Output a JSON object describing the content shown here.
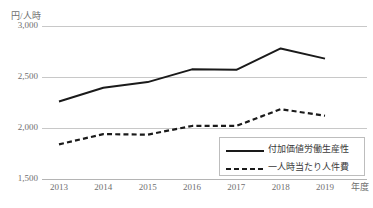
{
  "chart_data": {
    "type": "line",
    "title": "",
    "ylabel": "円/人時",
    "xlabel": "年度",
    "categories": [
      "2013",
      "2014",
      "2015",
      "2016",
      "2017",
      "2018",
      "2019"
    ],
    "ylim": [
      1500,
      3000
    ],
    "yticks": [
      "3,000",
      "2,500",
      "2,000",
      "1,500"
    ],
    "ytick_values": [
      3000,
      2500,
      2000,
      1500
    ],
    "grid": true,
    "legend_position": "bottom-right",
    "series": [
      {
        "name": "付加価値労働生産性",
        "style": "solid",
        "color": "#1a1a1a",
        "values": [
          2260,
          2395,
          2450,
          2575,
          2570,
          2780,
          2680
        ]
      },
      {
        "name": "一人時当たり人件費",
        "style": "dashed",
        "color": "#1a1a1a",
        "values": [
          1840,
          1940,
          1935,
          2020,
          2020,
          2185,
          2120
        ]
      }
    ]
  },
  "axes": {
    "y_unit_label": "円/人時",
    "x_unit_label": "年度"
  },
  "legend": {
    "items": [
      {
        "label": "付加価値労働生産性",
        "style": "solid"
      },
      {
        "label": "一人時当たり人件費",
        "style": "dashed"
      }
    ]
  }
}
